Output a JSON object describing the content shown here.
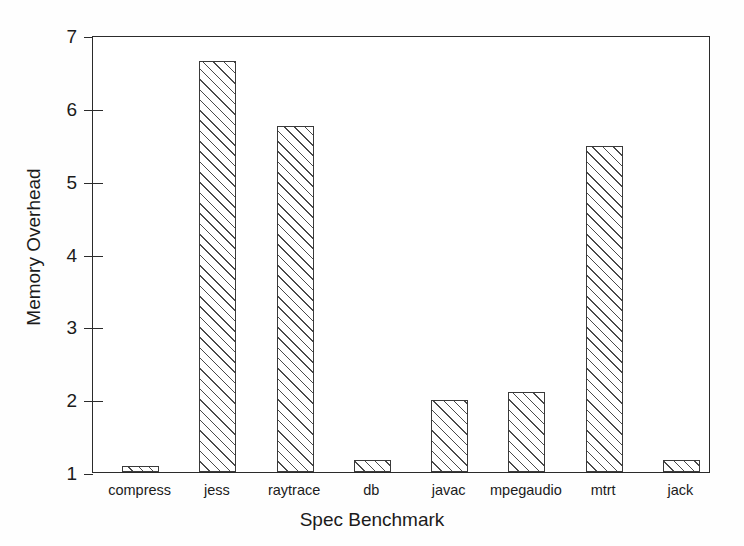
{
  "chart_data": {
    "type": "bar",
    "title": "",
    "xlabel": "Spec Benchmark",
    "ylabel": "Memory Overhead",
    "categories": [
      "compress",
      "jess",
      "raytrace",
      "db",
      "javac",
      "mpegaudio",
      "mtrt",
      "jack"
    ],
    "values": [
      1.08,
      6.64,
      5.75,
      1.17,
      1.99,
      2.1,
      5.48,
      1.16
    ],
    "ylim": [
      1,
      7
    ],
    "yticks": [
      1,
      2,
      3,
      4,
      5,
      6,
      7
    ],
    "ytick_labels": [
      "1",
      "2",
      "3",
      "4",
      "5",
      "6",
      "7"
    ],
    "grid": false,
    "legend": "none",
    "bar_fill": "white-with-diagonal-hatch",
    "bar_edge_color": "#3a3a3a",
    "hatch_color": "#4a4a4a",
    "axis_color": "#2b2b2b",
    "background": "#ffffff"
  }
}
